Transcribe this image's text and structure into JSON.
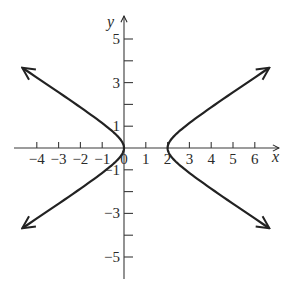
{
  "chart_data": {
    "type": "line",
    "title": "",
    "xlabel": "x",
    "ylabel": "y",
    "xlim": [
      -4.5,
      7
    ],
    "ylim": [
      -6,
      6
    ],
    "grid": false,
    "legend": null,
    "x_ticks": [
      -4,
      -3,
      -2,
      -1,
      0,
      1,
      2,
      3,
      4,
      5,
      6
    ],
    "x_tick_labels": [
      "−4",
      "−3",
      "−2",
      "−1",
      "0",
      "1",
      "2",
      "3",
      "4",
      "5",
      "6"
    ],
    "y_ticks": [
      -5,
      -4,
      -3,
      -2,
      -1,
      1,
      2,
      3,
      4,
      5
    ],
    "y_tick_labels": [
      {
        "value": 5,
        "label": "5"
      },
      {
        "value": 3,
        "label": "3"
      },
      {
        "value": 1,
        "label": "1"
      },
      {
        "value": -1,
        "label": "−1"
      },
      {
        "value": -3,
        "label": "−3"
      },
      {
        "value": -5,
        "label": "−5"
      }
    ],
    "series": [
      {
        "name": "hyperbola",
        "description": "Hyperbola centered at (1,0) with vertices (0,0) and (2,0), opening left and right; branches extend with arrows",
        "center": [
          1,
          0
        ],
        "a": 1,
        "b": 0.66,
        "vertices": [
          [
            0,
            0
          ],
          [
            2,
            0
          ]
        ],
        "branch_endpoints": [
          [
            -4.7,
            3.6
          ],
          [
            6.6,
            3.7
          ],
          [
            -4.7,
            -4.1
          ],
          [
            6.7,
            -4.1
          ]
        ],
        "color": "#222222"
      }
    ]
  }
}
